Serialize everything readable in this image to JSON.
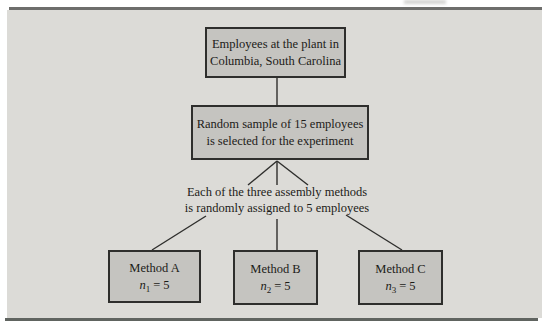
{
  "figure": {
    "type": "flowchart",
    "colors": {
      "panel_background": "#dcdbd7",
      "node_fill": "#c5c4c0",
      "node_border": "#2e2e2c",
      "top_rule": "#6e6e6c",
      "bottom_rule": "#606460",
      "text": "#1c1b18"
    },
    "nodes": {
      "population": {
        "line1": "Employees at the plant in",
        "line2": "Columbia, South Carolina"
      },
      "sample": {
        "line1": "Random sample of 15 employees",
        "line2": "is selected for the experiment"
      },
      "assignment_note": {
        "line1": "Each of the three assembly methods",
        "line2": "is randomly assigned to 5 employees"
      },
      "methods": [
        {
          "label": "Method A",
          "var": "n",
          "sub": "1",
          "eq": "= 5"
        },
        {
          "label": "Method B",
          "var": "n",
          "sub": "2",
          "eq": "= 5"
        },
        {
          "label": "Method C",
          "var": "n",
          "sub": "3",
          "eq": "= 5"
        }
      ]
    }
  }
}
